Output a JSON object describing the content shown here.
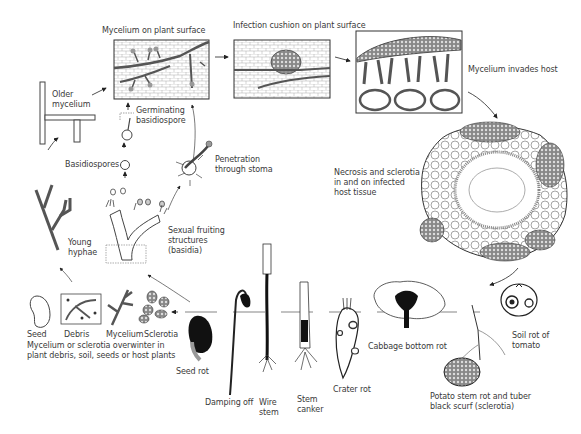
{
  "labels": {
    "mycelium_on_surface": "Mycelium on plant surface",
    "infection_cushion": "Infection cushion on plant surface",
    "mycelium_invades": "Mycelium invades host",
    "older_mycelium": "Older\nmycelium",
    "germinating": "Germinating\nbasidiospore",
    "basidiospores": "Basidiospores",
    "penetration": "Penetration\nthrough stoma",
    "necrosis": "Necrosis and sclerotia\nin and on infected\nhost tissue",
    "young_hyphae": "Young\nhyphae",
    "sexual_fruiting": "Sexual fruiting\nstructures",
    "basidia": "(basidia)",
    "seed": "Seed",
    "debris": "Debris",
    "mycelium": "Mycelium",
    "sclerotia": "Sclerotia",
    "overwinter": "Mycelium or sclerotia overwinter in\nplant debris, soil, seeds or host plants",
    "seed_rot": "Seed rot",
    "damping_off": "Damping off",
    "wire_stem": "Wire\nstem",
    "stem_canker": "Stem\ncanker",
    "crater_rot": "Crater rot",
    "cabbage": "Cabbage bottom rot",
    "potato": "Potato stem rot and tuber\nblack scurf (sclerotia)",
    "tomato": "Soil rot of\ntomato"
  }
}
